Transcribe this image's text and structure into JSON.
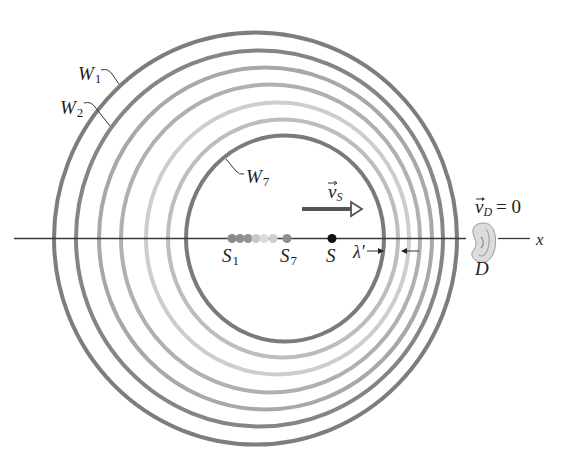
{
  "figure": {
    "wavefronts": [
      {
        "id": "W1",
        "cx": 255.5,
        "cy": 238.5,
        "rx": 201.5,
        "ry": 206,
        "color": "#7d7d7d"
      },
      {
        "id": "W2",
        "cx": 259.5,
        "cy": 238.5,
        "rx": 183.5,
        "ry": 188,
        "color": "#858585"
      },
      {
        "id": "W3",
        "cx": 265.5,
        "cy": 238.5,
        "rx": 166.5,
        "ry": 171,
        "color": "#a8a8a8"
      },
      {
        "id": "W4",
        "cx": 270.5,
        "cy": 238.5,
        "rx": 149.5,
        "ry": 154,
        "color": "#b0b0b0"
      },
      {
        "id": "W5",
        "cx": 277.5,
        "cy": 238.5,
        "rx": 131.5,
        "ry": 136,
        "color": "#cdcdcd"
      },
      {
        "id": "W6",
        "cx": 283,
        "cy": 238.5,
        "rx": 115,
        "ry": 119,
        "color": "#bdbdbd"
      },
      {
        "id": "W7",
        "cx": 285,
        "cy": 238.5,
        "rx": 99,
        "ry": 103,
        "color": "#7a7a7a"
      }
    ],
    "source_positions": [
      {
        "x": 232,
        "color": "#8a8a8a"
      },
      {
        "x": 240,
        "color": "#8f8f8f"
      },
      {
        "x": 248,
        "color": "#939393"
      },
      {
        "x": 256,
        "color": "#c8c8c8"
      },
      {
        "x": 264,
        "color": "#dadada"
      },
      {
        "x": 273,
        "color": "#cfcfcf"
      },
      {
        "x": 287,
        "color": "#8d8d8d"
      }
    ],
    "labels": {
      "w1": "W",
      "w1_sub": "1",
      "w2": "W",
      "w2_sub": "2",
      "w7": "W",
      "w7_sub": "7",
      "s1": "S",
      "s1_sub": "1",
      "s7": "S",
      "s7_sub": "7",
      "s": "S",
      "vs": "v",
      "vs_sub": "S",
      "vd": "v",
      "vd_sub": "D",
      "vd_value": "= 0",
      "lambda": "λ′",
      "detector": "D",
      "axis": "x"
    },
    "colors": {
      "axis": "#3a3a3a",
      "source_current": "#111111",
      "velocity_arrow": "#555555",
      "ear_fill": "#d8d8d8",
      "ear_stroke": "#9a9a9a"
    }
  }
}
